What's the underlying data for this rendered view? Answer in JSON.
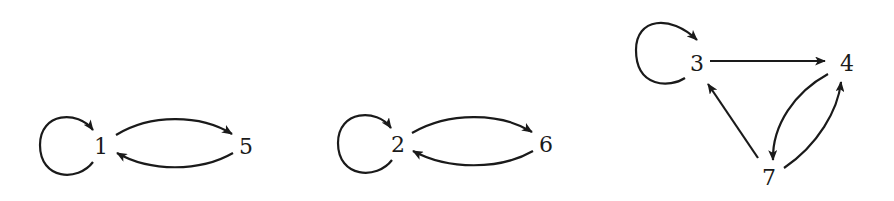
{
  "diagram": {
    "type": "directed-graph",
    "colors": {
      "ink": "#1a1a1a",
      "background": "#ffffff"
    },
    "nodes": [
      {
        "id": "1",
        "label": "1"
      },
      {
        "id": "5",
        "label": "5"
      },
      {
        "id": "2",
        "label": "2"
      },
      {
        "id": "6",
        "label": "6"
      },
      {
        "id": "3",
        "label": "3"
      },
      {
        "id": "4",
        "label": "4"
      },
      {
        "id": "7",
        "label": "7"
      }
    ],
    "edges": [
      {
        "from": "1",
        "to": "1",
        "kind": "self-loop"
      },
      {
        "from": "1",
        "to": "5"
      },
      {
        "from": "5",
        "to": "1"
      },
      {
        "from": "2",
        "to": "2",
        "kind": "self-loop"
      },
      {
        "from": "2",
        "to": "6"
      },
      {
        "from": "6",
        "to": "2"
      },
      {
        "from": "3",
        "to": "3",
        "kind": "self-loop"
      },
      {
        "from": "3",
        "to": "4"
      },
      {
        "from": "4",
        "to": "7"
      },
      {
        "from": "7",
        "to": "4"
      },
      {
        "from": "7",
        "to": "3"
      }
    ],
    "components": [
      {
        "nodes": [
          "1",
          "5"
        ]
      },
      {
        "nodes": [
          "2",
          "6"
        ]
      },
      {
        "nodes": [
          "3",
          "4",
          "7"
        ]
      }
    ]
  }
}
